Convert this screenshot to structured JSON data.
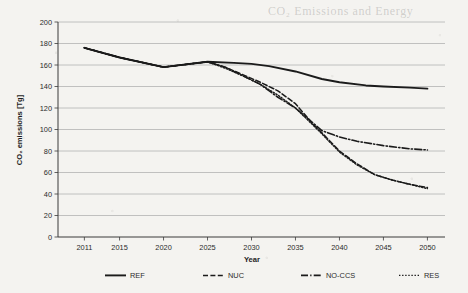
{
  "ghost_text": {
    "top": "CO₂ Emissions and Energy",
    "mid": "scanned page bleed",
    "low": "scanned page bleed"
  },
  "chart_data": {
    "type": "line",
    "title": "",
    "xlabel": "Year",
    "ylabel": "CO₂ emissions [Tg]",
    "xlim": [
      2008,
      2052
    ],
    "ylim": [
      0,
      200
    ],
    "ytick_step": 20,
    "yticks": [
      0,
      20,
      40,
      60,
      80,
      100,
      120,
      140,
      160,
      180,
      200
    ],
    "xticks": [
      2011,
      2015,
      2020,
      2025,
      2030,
      2035,
      2040,
      2045,
      2050
    ],
    "grid": "horizontal",
    "legend_position": "bottom",
    "series": [
      {
        "name": "REF",
        "style": "solid",
        "x": [
          2011,
          2015,
          2020,
          2025,
          2028,
          2030,
          2032,
          2035,
          2038,
          2040,
          2043,
          2045,
          2048,
          2050
        ],
        "values": [
          176,
          167,
          158,
          163,
          162,
          161,
          159,
          154,
          147,
          144,
          141,
          140,
          139,
          138
        ]
      },
      {
        "name": "NUC",
        "style": "dashed",
        "x": [
          2011,
          2015,
          2020,
          2025,
          2027,
          2029,
          2031,
          2033,
          2035,
          2037,
          2038,
          2040,
          2042,
          2044,
          2046,
          2048,
          2050
        ],
        "values": [
          176,
          167,
          158,
          163,
          158,
          151,
          144,
          136,
          124,
          105,
          97,
          80,
          68,
          58,
          53,
          49,
          46
        ]
      },
      {
        "name": "NO-CCS",
        "style": "dash-dot",
        "x": [
          2011,
          2015,
          2020,
          2025,
          2027,
          2029,
          2031,
          2033,
          2035,
          2037,
          2038,
          2040,
          2042,
          2045,
          2048,
          2050
        ],
        "values": [
          176,
          167,
          158,
          163,
          158,
          150,
          142,
          130,
          120,
          106,
          99,
          93,
          89,
          85,
          82,
          81
        ]
      },
      {
        "name": "RES",
        "style": "dotted",
        "x": [
          2011,
          2015,
          2020,
          2025,
          2027,
          2029,
          2031,
          2033,
          2035,
          2037,
          2038,
          2040,
          2042,
          2044,
          2046,
          2048,
          2050
        ],
        "values": [
          176,
          167,
          158,
          163,
          157,
          150,
          142,
          132,
          120,
          104,
          96,
          79,
          67,
          58,
          53,
          49,
          45
        ]
      }
    ]
  },
  "legend": {
    "items": [
      {
        "label": "REF",
        "style": "solid"
      },
      {
        "label": "NUC",
        "style": "dashed"
      },
      {
        "label": "NO-CCS",
        "style": "dash-dot"
      },
      {
        "label": "RES",
        "style": "dotted"
      }
    ]
  },
  "colors": {
    "series": "#1b1b1b",
    "grid": "#b3b3b3",
    "axis": "#3a3a3a",
    "background": "#f4f3f0"
  }
}
